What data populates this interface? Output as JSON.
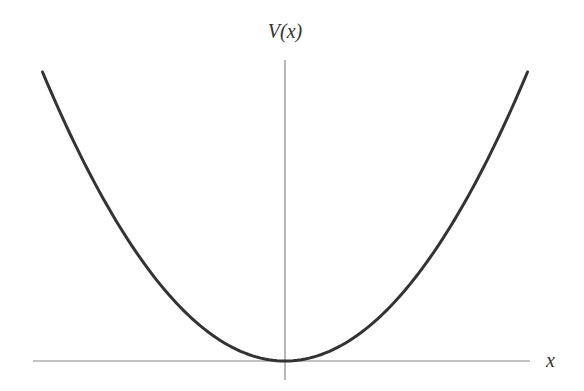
{
  "chart_data": {
    "type": "line",
    "title": "",
    "xlabel": "x",
    "ylabel": "V(x)",
    "function": "V(x) = k x^2 (parabola, minimum at origin)",
    "grid": false,
    "legend": null,
    "tick_labels": [],
    "series": [
      {
        "name": "V(x)",
        "x": [
          -1.0,
          -0.8,
          -0.6,
          -0.4,
          -0.2,
          0.0,
          0.2,
          0.4,
          0.6,
          0.8,
          1.0
        ],
        "values": [
          1.0,
          0.64,
          0.36,
          0.16,
          0.04,
          0.0,
          0.04,
          0.16,
          0.36,
          0.64,
          1.0
        ]
      }
    ],
    "xlim": [
      -1.0,
      1.0
    ],
    "ylim": [
      0,
      1.0
    ]
  },
  "labels": {
    "y_axis": "V(x)",
    "x_axis": "x"
  },
  "colors": {
    "curve": "#333333",
    "axes": "#777777",
    "text": "#333333"
  }
}
